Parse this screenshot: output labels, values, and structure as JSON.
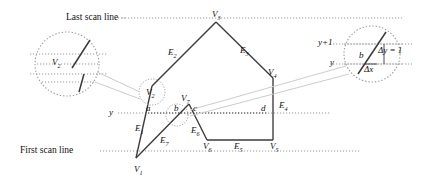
{
  "figure": {
    "title_note": "Scan-line polygon fill with edge coherence detail",
    "colors": {
      "stroke": "#3a3a3a",
      "dotted": "#8d8d8d",
      "leader": "#c0c0c0",
      "text": "#111111"
    }
  },
  "scanlines": {
    "last_label": "Last scan line",
    "first_label": "First scan line",
    "y_label": "y",
    "y_plus_one_label": "y+1"
  },
  "vertices": [
    {
      "id": "v1",
      "base": "V",
      "sub": "1",
      "x": 134,
      "y": 165
    },
    {
      "id": "v2",
      "base": "V",
      "sub": "2",
      "x": 150,
      "y": 93
    },
    {
      "id": "v3",
      "base": "V",
      "sub": "3",
      "x": 216,
      "y": 11
    },
    {
      "id": "v4",
      "base": "V",
      "sub": "4",
      "x": 276,
      "y": 73
    },
    {
      "id": "v5",
      "base": "V",
      "sub": "5",
      "x": 276,
      "y": 143
    },
    {
      "id": "v6",
      "base": "V",
      "sub": "6",
      "x": 208,
      "y": 143
    },
    {
      "id": "v7",
      "base": "V",
      "sub": "7",
      "x": 185,
      "y": 110
    }
  ],
  "edges": [
    {
      "id": "e1",
      "base": "E",
      "sub": "1",
      "x": 140,
      "y": 127
    },
    {
      "id": "e2",
      "base": "E",
      "sub": "2",
      "x": 173,
      "y": 52
    },
    {
      "id": "e3",
      "base": "E",
      "sub": "3",
      "x": 248,
      "y": 50
    },
    {
      "id": "e4",
      "base": "E",
      "sub": "4",
      "x": 286,
      "y": 105
    },
    {
      "id": "e5",
      "base": "E",
      "sub": "5",
      "x": 240,
      "y": 148
    },
    {
      "id": "e6",
      "base": "E",
      "sub": "6",
      "x": 196,
      "y": 130
    },
    {
      "id": "e7",
      "base": "E",
      "sub": "7",
      "x": 165,
      "y": 140
    }
  ],
  "intersections": [
    {
      "id": "a",
      "label": "a",
      "x": 148,
      "y": 113
    },
    {
      "id": "b",
      "label": "b",
      "x": 176,
      "y": 113
    },
    {
      "id": "c",
      "label": "c",
      "x": 195,
      "y": 113
    },
    {
      "id": "d",
      "label": "d",
      "x": 264,
      "y": 113
    }
  ],
  "detail_left": {
    "vertex_base": "V",
    "vertex_sub": "2"
  },
  "detail_right": {
    "point_label": "b",
    "delta_y_label": "Δy = 1",
    "delta_x_label": "Δx"
  }
}
